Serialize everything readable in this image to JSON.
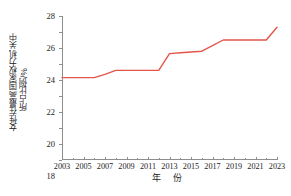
{
  "chart_data": {
    "type": "line",
    "title": "",
    "xlabel": "年  份",
    "ylabel_line1": "女性在最高国家权力机关中",
    "ylabel_line2": "所占比例/%",
    "ylabel": "女性在最高国家权力机关中所占比例/%",
    "xlim": [
      2003,
      2023
    ],
    "ylim": [
      10,
      28
    ],
    "grid": false,
    "legend": false,
    "series_color": "#e4564a",
    "axis_color": "#8d8d8d",
    "x": [
      2003,
      2004,
      2005,
      2006,
      2007,
      2008,
      2009,
      2010,
      2011,
      2012,
      2013,
      2014,
      2015,
      2016,
      2017,
      2018,
      2019,
      2020,
      2021,
      2022,
      2023
    ],
    "values": [
      20.3,
      20.3,
      20.3,
      20.3,
      20.7,
      21.2,
      21.2,
      21.2,
      21.2,
      21.2,
      23.3,
      23.4,
      23.5,
      23.6,
      24.3,
      25.0,
      25.0,
      25.0,
      25.0,
      25.0,
      26.6
    ],
    "series": [
      {
        "name": "女性在最高国家权力机关中所占比例",
        "values": [
          20.3,
          20.3,
          20.3,
          20.3,
          20.7,
          21.2,
          21.2,
          21.2,
          21.2,
          21.2,
          23.3,
          23.4,
          23.5,
          23.6,
          24.3,
          25.0,
          25.0,
          25.0,
          25.0,
          25.0,
          26.6
        ]
      }
    ],
    "ytick_labels": [
      "10",
      "12",
      "14",
      "16",
      "18",
      "20",
      "22",
      "24",
      "26",
      "28"
    ],
    "ytick_values": [
      10,
      12,
      14,
      16,
      18,
      20,
      22,
      24,
      26,
      28
    ],
    "xtick_labels": [
      "2003",
      "2005",
      "2007",
      "2009",
      "2011",
      "2013",
      "2015",
      "2017",
      "2019",
      "2021",
      "2023"
    ],
    "xtick_values": [
      2003,
      2005,
      2007,
      2009,
      2011,
      2013,
      2015,
      2017,
      2019,
      2021,
      2023
    ],
    "xtick_minor_values": [
      2004,
      2006,
      2008,
      2010,
      2012,
      2014,
      2016,
      2018,
      2020,
      2022
    ]
  }
}
